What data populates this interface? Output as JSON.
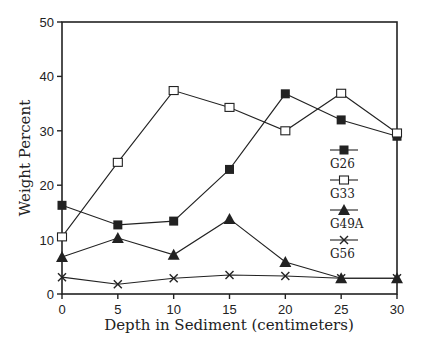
{
  "chart_data": {
    "type": "line",
    "title": "",
    "xlabel": "Depth in Sediment (centimeters)",
    "ylabel": "Weight Percent",
    "x": [
      0,
      5,
      10,
      15,
      20,
      25,
      30
    ],
    "xlim": [
      0,
      30
    ],
    "ylim": [
      0,
      50
    ],
    "xticks": [
      0,
      5,
      10,
      15,
      20,
      25,
      30
    ],
    "yticks": [
      0,
      10,
      20,
      30,
      40,
      50
    ],
    "grid": false,
    "legend_position": "right-inside",
    "series": [
      {
        "name": "G26",
        "marker": "filled-square",
        "values": [
          16.3,
          12.7,
          13.4,
          22.9,
          36.8,
          32.0,
          29.0
        ]
      },
      {
        "name": "G33",
        "marker": "open-square",
        "values": [
          10.5,
          24.2,
          37.4,
          34.3,
          30.0,
          36.9,
          29.6
        ]
      },
      {
        "name": "G49A",
        "marker": "filled-triangle",
        "values": [
          6.8,
          10.3,
          7.2,
          13.8,
          5.9,
          2.9,
          2.9
        ]
      },
      {
        "name": "G56",
        "marker": "x-cross",
        "values": [
          3.1,
          1.8,
          2.9,
          3.5,
          3.3,
          2.9,
          2.9
        ]
      }
    ]
  },
  "colors": {
    "line": "#222222",
    "axis": "#222222",
    "background": "#ffffff"
  }
}
